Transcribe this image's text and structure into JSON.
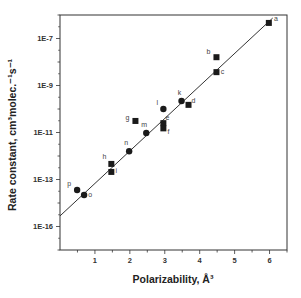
{
  "chart_data": {
    "type": "scatter",
    "title": "",
    "xlabel": "Polarizability, Å³",
    "ylabel": "Rate constant, cm³molec.⁻¹s⁻¹",
    "xlim": [
      0,
      6.5
    ],
    "ylim_log10": [
      -16,
      -6
    ],
    "yscale": "log",
    "grid": false,
    "legend": "none",
    "x_ticks": [
      {
        "value": 1,
        "label": "1"
      },
      {
        "value": 2,
        "label": "2"
      },
      {
        "value": 3,
        "label": "3"
      },
      {
        "value": 4,
        "label": "4"
      },
      {
        "value": 5,
        "label": "5"
      },
      {
        "value": 6,
        "label": "6"
      }
    ],
    "y_ticks": [
      {
        "log10": -7,
        "label": "1E-7"
      },
      {
        "log10": -9,
        "label": "1E-9"
      },
      {
        "log10": -11,
        "label": "1E-11"
      },
      {
        "log10": -13,
        "label": "1E-13"
      },
      {
        "log10": -15,
        "label": "1E-16"
      }
    ],
    "series": [
      {
        "name": "squares",
        "marker": "square",
        "points": [
          {
            "label": "a",
            "x": 5.98,
            "y": 4.6e-07
          },
          {
            "label": "b",
            "x": 4.48,
            "y": 1.6e-08
          },
          {
            "label": "c",
            "x": 4.48,
            "y": 3.7e-09
          },
          {
            "label": "d",
            "x": 3.68,
            "y": 1.5e-10
          },
          {
            "label": "e",
            "x": 2.96,
            "y": 2.5e-11
          },
          {
            "label": "f",
            "x": 2.96,
            "y": 1.5e-11
          },
          {
            "label": "g",
            "x": 2.16,
            "y": 3.1e-11
          },
          {
            "label": "h",
            "x": 1.47,
            "y": 4.6e-13
          },
          {
            "label": "i",
            "x": 1.47,
            "y": 2.1e-13
          }
        ]
      },
      {
        "name": "circles",
        "marker": "circle",
        "points": [
          {
            "label": "k",
            "x": 3.48,
            "y": 2.2e-10
          },
          {
            "label": "l",
            "x": 2.96,
            "y": 1e-10
          },
          {
            "label": "m",
            "x": 2.47,
            "y": 9.5e-12
          },
          {
            "label": "n",
            "x": 1.98,
            "y": 1.6e-12
          },
          {
            "label": "o",
            "x": 0.69,
            "y": 2.2e-14
          },
          {
            "label": "p",
            "x": 0.49,
            "y": 3.6e-14
          }
        ]
      }
    ],
    "fit_line": {
      "x": [
        0,
        6.09
      ],
      "log10_y": [
        -14.55,
        -6.13
      ]
    },
    "colors": {
      "marker": "#1a1a1a",
      "line": "#333333",
      "axis": "#333333"
    }
  }
}
